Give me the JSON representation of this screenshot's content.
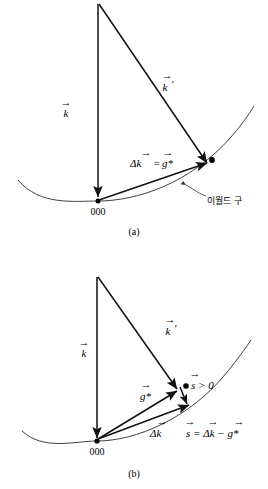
{
  "figure": {
    "title_present": false,
    "panels": [
      {
        "id": "a",
        "caption": "(a)",
        "origin_label": "000",
        "labels": {
          "k_incident": "k",
          "k_scattered": "k",
          "k_scattered_prime": "′",
          "delta_k_equation_lhs": "Δk",
          "delta_k_equation_eq": "=",
          "delta_k_equation_rhs": "g*",
          "ewald_sphere": "이월드 구"
        },
        "vector_arrow_glyph": "→"
      },
      {
        "id": "b",
        "caption": "(b)",
        "origin_label": "000",
        "labels": {
          "k_incident": "k",
          "k_scattered": "k",
          "k_scattered_prime": "′",
          "g_star": "g*",
          "delta_k": "Δk",
          "s_condition": "s > 0",
          "s_equation": "s = Δk − g*"
        },
        "vector_arrow_glyph": "→"
      }
    ]
  },
  "colors": {
    "background": "#ffffff",
    "ink": "#000000",
    "line": "#2b2b2b",
    "vector": "#111111"
  }
}
